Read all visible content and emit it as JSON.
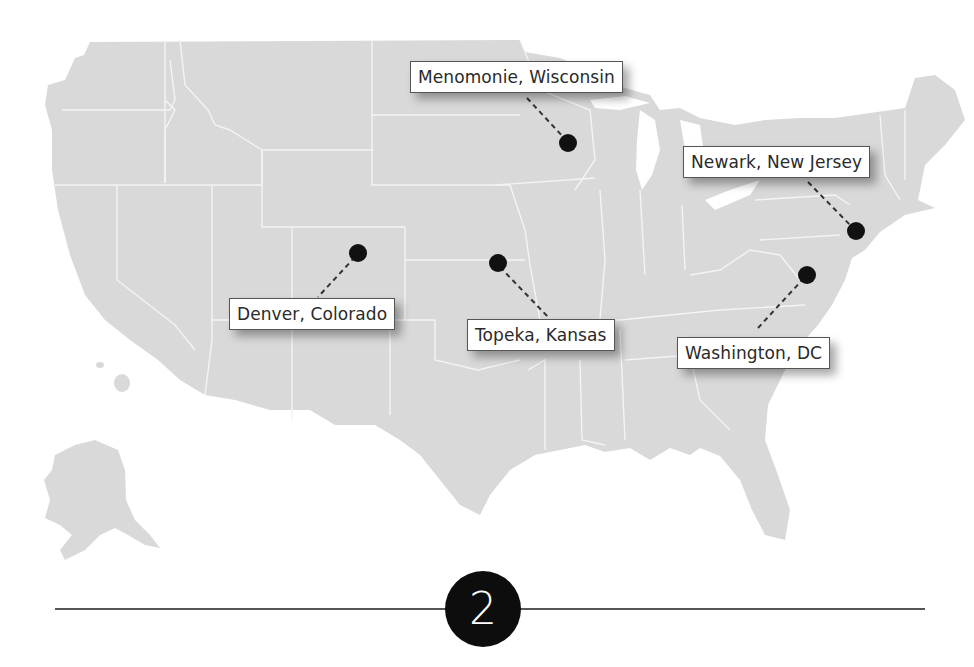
{
  "map": {
    "title": "United States locations map",
    "land_color": "#d9d9d9",
    "border_color": "#f4f4f4",
    "pin_color": "#111111",
    "locations": [
      {
        "label": "Menomonie, Wisconsin",
        "pin": [
          568,
          143
        ]
      },
      {
        "label": "Newark, New Jersey",
        "pin": [
          856,
          231
        ]
      },
      {
        "label": "Denver, Colorado",
        "pin": [
          358,
          253
        ]
      },
      {
        "label": "Topeka, Kansas",
        "pin": [
          498,
          263
        ]
      },
      {
        "label": "Washington, DC",
        "pin": [
          807,
          275
        ]
      }
    ]
  },
  "step": {
    "number": "2"
  }
}
